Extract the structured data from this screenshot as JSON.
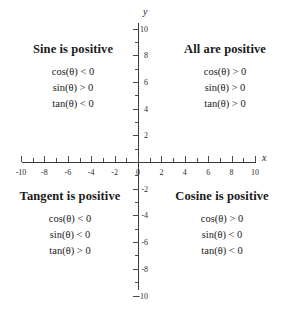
{
  "chart_data": {
    "type": "scatter",
    "title": "",
    "xlabel": "x",
    "ylabel": "y",
    "xlim": [
      -10,
      10
    ],
    "ylim": [
      -10,
      10
    ],
    "grid": false,
    "legend": "none",
    "x_ticks": [
      "-10",
      "-8",
      "-6",
      "-4",
      "-2",
      "0",
      "2",
      "4",
      "6",
      "8",
      "10"
    ],
    "x_tick_values": [
      -10,
      -8,
      -6,
      -4,
      -2,
      0,
      2,
      4,
      6,
      8,
      10
    ],
    "y_ticks": [
      "10",
      "8",
      "6",
      "4",
      "2",
      "0",
      "-2",
      "-4",
      "-6",
      "-8",
      "-10"
    ],
    "y_tick_values": [
      10,
      8,
      6,
      4,
      2,
      0,
      -2,
      -4,
      -6,
      -8,
      -10
    ],
    "minor_tick_step": 1,
    "annotations": [
      {
        "quadrant": 2,
        "title": "Sine is positive",
        "lines": [
          "cos(θ) < 0",
          "sin(θ) > 0",
          "tan(θ) < 0"
        ]
      },
      {
        "quadrant": 1,
        "title": "All are positive",
        "lines": [
          "cos(θ) > 0",
          "sin(θ) > 0",
          "tan(θ) > 0"
        ]
      },
      {
        "quadrant": 3,
        "title": "Tangent is positive",
        "lines": [
          "cos(θ) < 0",
          "sin(θ) < 0",
          "tan(θ) > 0"
        ]
      },
      {
        "quadrant": 4,
        "title": "Cosine is positive",
        "lines": [
          "cos(θ) > 0",
          "sin(θ) < 0",
          "tan(θ) < 0"
        ]
      }
    ]
  },
  "axes": {
    "x_label": "x",
    "y_label": "y"
  },
  "quadrant_2": {
    "title": "Sine is positive",
    "cos": "cos(θ) < 0",
    "sin": "sin(θ) > 0",
    "tan": "tan(θ) < 0"
  },
  "quadrant_1": {
    "title": "All are positive",
    "cos": "cos(θ) > 0",
    "sin": "sin(θ) > 0",
    "tan": "tan(θ) > 0"
  },
  "quadrant_3": {
    "title": "Tangent is positive",
    "cos": "cos(θ) < 0",
    "sin": "sin(θ) < 0",
    "tan": "tan(θ) > 0"
  },
  "quadrant_4": {
    "title": "Cosine is positive",
    "cos": "cos(θ) > 0",
    "sin": "sin(θ) < 0",
    "tan": "tan(θ) < 0"
  },
  "colors": {
    "background": "#ffffff",
    "axis": "#3a3a3a",
    "text": "#1a1a1a"
  }
}
